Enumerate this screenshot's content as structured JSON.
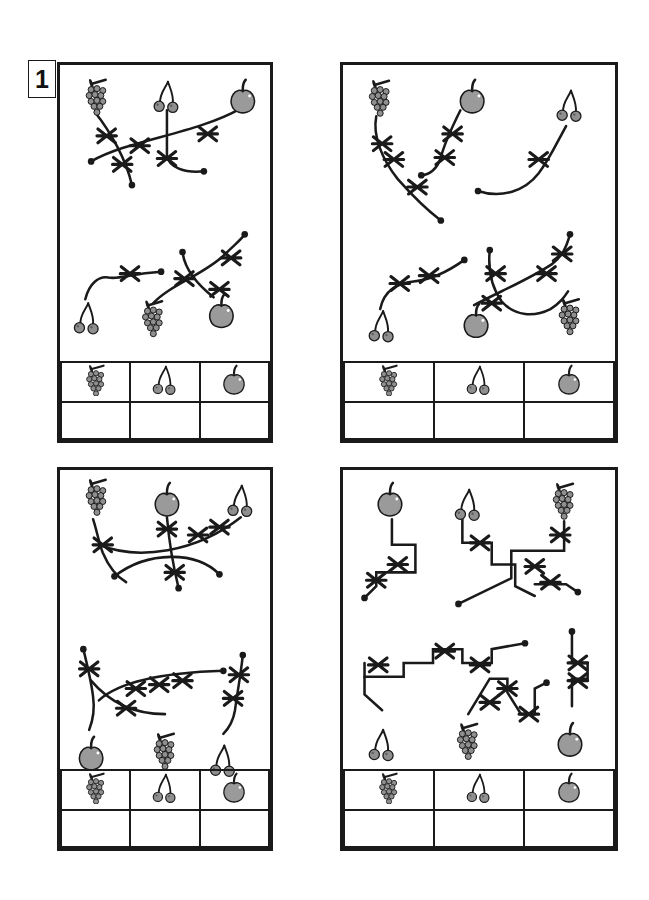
{
  "worksheet": {
    "exercise_number": "1",
    "panel_count": 4,
    "ink_color": "#1a1a1a",
    "fruit_fill": "#9a9a9a",
    "fruit_stroke": "#1a1a1a",
    "line_style_note": "tangled paths with X crossing marks and dot endpoints"
  },
  "icons": {
    "grapes": "grapes-icon",
    "cherries": "cherries-icon",
    "apple": "apple-icon",
    "cross": "x-cross-mark",
    "dot": "path-endpoint-dot"
  },
  "answer_table": {
    "columns": [
      {
        "icon": "grapes",
        "label": "grapes",
        "answer": ""
      },
      {
        "icon": "cherries",
        "label": "cherries",
        "answer": ""
      },
      {
        "icon": "apple",
        "label": "apple",
        "answer": ""
      }
    ]
  },
  "panels": [
    {
      "id": "panel-top-left",
      "position": "top-left",
      "path_style": "curved",
      "fruits_top": [
        "grapes",
        "cherries",
        "apple"
      ],
      "fruits_bottom": [
        "cherries",
        "grapes",
        "apple"
      ],
      "cross_count_top": 5,
      "cross_count_bottom": 5
    },
    {
      "id": "panel-top-right",
      "position": "top-right",
      "path_style": "curved",
      "fruits_top": [
        "grapes",
        "apple",
        "cherries"
      ],
      "fruits_bottom": [
        "cherries",
        "apple",
        "grapes"
      ],
      "cross_count_top": 6,
      "cross_count_bottom": 6
    },
    {
      "id": "panel-bottom-left",
      "position": "bottom-left",
      "path_style": "curved",
      "fruits_top": [
        "grapes",
        "apple",
        "cherries"
      ],
      "fruits_bottom": [
        "apple",
        "grapes",
        "cherries"
      ],
      "cross_count_top": 5,
      "cross_count_bottom": 7
    },
    {
      "id": "panel-bottom-right",
      "position": "bottom-right",
      "path_style": "orthogonal",
      "fruits_top": [
        "apple",
        "cherries",
        "grapes"
      ],
      "fruits_bottom": [
        "cherries",
        "grapes",
        "apple"
      ],
      "cross_count_top": 5,
      "cross_count_bottom": 8
    }
  ]
}
